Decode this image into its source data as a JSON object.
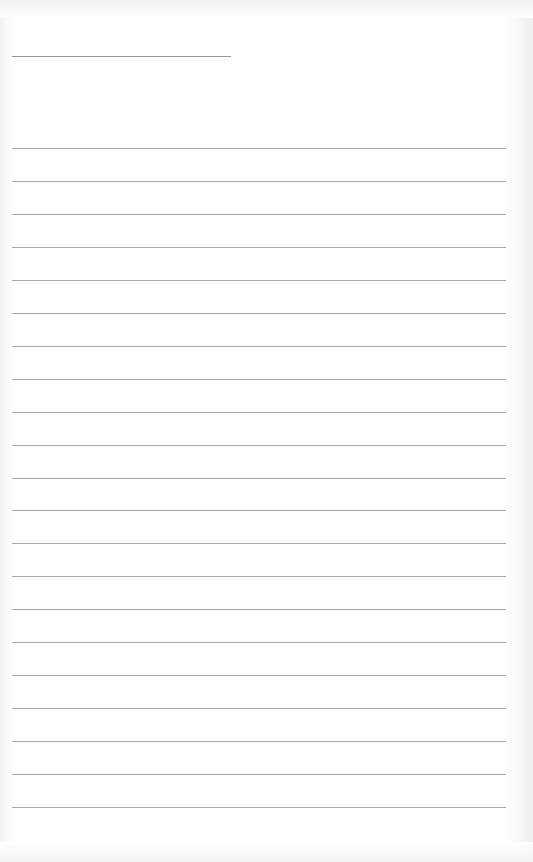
{
  "page": {
    "type": "lined-notebook-page",
    "header_bleed_text": "",
    "name_line": {
      "visible": true
    },
    "rules": {
      "count": 21,
      "first_y": 148,
      "spacing": 32.95,
      "left": 12,
      "width": 494,
      "color": "#a8a8a8"
    },
    "colors": {
      "paper": "#ffffff",
      "rule": "#a8a8a8",
      "name_line": "#9a9a9a"
    }
  }
}
